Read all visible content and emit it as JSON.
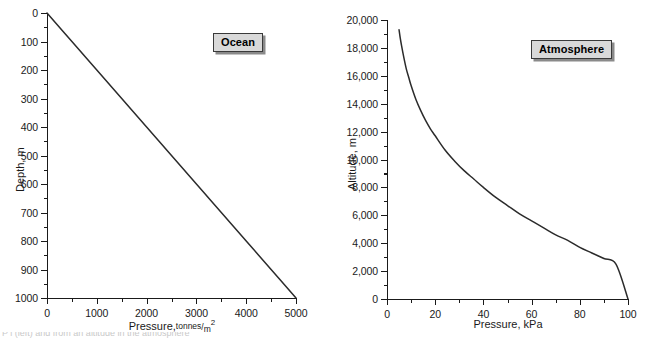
{
  "figure": {
    "background_color": "#ffffff",
    "line_color": "#2b2b2b",
    "callout_fill": "#d9d9d9",
    "callout_border": "#3a3a3a"
  },
  "panels": [
    {
      "key": "ocean",
      "callout_label": "Ocean",
      "xlabel_main": "Pressure,",
      "xlabel_unit_num": "tonnes",
      "xlabel_unit_den": "m",
      "xlabel_unit_exp": "2",
      "ylabel": "Depth, m",
      "x_ticklabels": [
        "0",
        "1000",
        "2000",
        "3000",
        "4000",
        "5000"
      ],
      "y_ticklabels": [
        "0",
        "100",
        "200",
        "300",
        "400",
        "500",
        "600",
        "700",
        "800",
        "900",
        "1000"
      ]
    },
    {
      "key": "atmosphere",
      "callout_label": "Atmosphere",
      "xlabel_main": "Pressure, kPa",
      "ylabel": "Altitude, m",
      "x_ticklabels": [
        "0",
        "20",
        "40",
        "60",
        "80",
        "100"
      ],
      "y_ticklabels": [
        "0",
        "2,000",
        "4,000",
        "6,000",
        "8,000",
        "10,000",
        "12,000",
        "14,000",
        "16,000",
        "18,000",
        "20,000"
      ]
    }
  ],
  "caption_partial": "P                  l        (left) and from an altitude in the atmosphere",
  "chart_data": [
    {
      "type": "line",
      "title": "Ocean",
      "xlabel": "Pressure, tonnes/m2",
      "ylabel": "Depth, m",
      "xlim": [
        0,
        5000
      ],
      "ylim": [
        0,
        1000
      ],
      "y_inverted": true,
      "grid": false,
      "legend": "none",
      "x_major_ticks": [
        0,
        1000,
        2000,
        3000,
        4000,
        5000
      ],
      "x_minor_ticks": [
        500,
        1500,
        2500,
        3500,
        4500
      ],
      "y_major_ticks": [
        0,
        100,
        200,
        300,
        400,
        500,
        600,
        700,
        800,
        900,
        1000
      ],
      "y_minor_ticks": [
        50,
        150,
        250,
        350,
        450,
        550,
        650,
        750,
        850,
        950
      ],
      "annotations": [
        "Ocean"
      ],
      "series": [
        {
          "name": "Ocean pressure vs depth",
          "x": [
            0,
            500,
            1000,
            1500,
            2000,
            2500,
            3000,
            3500,
            4000,
            4500,
            5000
          ],
          "y": [
            0,
            100,
            200,
            300,
            400,
            500,
            600,
            700,
            800,
            900,
            1000
          ]
        }
      ]
    },
    {
      "type": "line",
      "title": "Atmosphere",
      "xlabel": "Pressure, kPa",
      "ylabel": "Altitude, m",
      "xlim": [
        0,
        100
      ],
      "ylim": [
        0,
        20000
      ],
      "y_inverted": false,
      "grid": false,
      "legend": "none",
      "x_major_ticks": [
        0,
        20,
        40,
        60,
        80,
        100
      ],
      "x_minor_ticks": [
        10,
        30,
        50,
        70,
        90
      ],
      "y_major_ticks": [
        0,
        2000,
        4000,
        6000,
        8000,
        10000,
        12000,
        14000,
        16000,
        18000,
        20000
      ],
      "y_minor_ticks": [
        1000,
        3000,
        5000,
        7000,
        9000,
        11000,
        13000,
        15000,
        17000,
        19000
      ],
      "annotations": [
        "Atmosphere"
      ],
      "series": [
        {
          "name": "Atmospheric pressure vs altitude",
          "x": [
            5.0,
            5.5,
            6.0,
            7.0,
            8.0,
            9.0,
            10.0,
            12.0,
            14.0,
            16.0,
            18.0,
            20.0,
            24.0,
            28.0,
            32.0,
            36.0,
            40.0,
            45.0,
            50.0,
            55.0,
            60.0,
            65.0,
            70.0,
            75.0,
            80.0,
            85.0,
            90.0,
            95.0,
            100.0
          ],
          "y": [
            19300,
            18700,
            18200,
            17300,
            16500,
            15900,
            15300,
            14300,
            13500,
            12800,
            12200,
            11700,
            10700,
            9900,
            9200,
            8600,
            8000,
            7300,
            6700,
            6100,
            5600,
            5100,
            4600,
            4200,
            3700,
            3300,
            2900,
            2500,
            0
          ]
        }
      ]
    }
  ]
}
